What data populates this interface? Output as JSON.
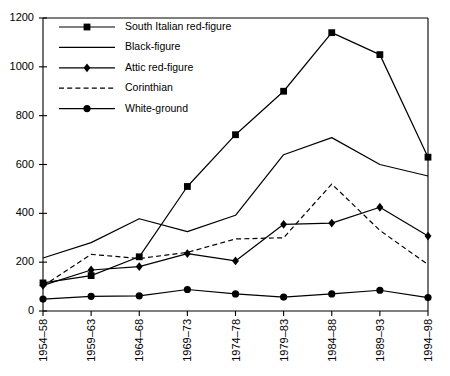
{
  "chart_data": {
    "type": "line",
    "title": "",
    "xlabel": "",
    "ylabel": "",
    "ylim": [
      0,
      1200
    ],
    "yticks": [
      0,
      200,
      400,
      600,
      800,
      1000,
      1200
    ],
    "grid": false,
    "legend_position": "top-left",
    "categories": [
      "1954–58",
      "1959–63",
      "1964–68",
      "1969–73",
      "1974–78",
      "1979–83",
      "1984–88",
      "1989–93",
      "1994–98"
    ],
    "series": [
      {
        "name": "South Italian red-figure",
        "marker": "square",
        "line_style": "solid",
        "color": "#000000",
        "values": [
          115,
          145,
          222,
          510,
          722,
          900,
          1140,
          1050,
          630
        ]
      },
      {
        "name": "Black-figure",
        "marker": "none",
        "line_style": "solid",
        "color": "#000000",
        "values": [
          217,
          280,
          378,
          325,
          392,
          640,
          710,
          600,
          553
        ]
      },
      {
        "name": "Attic red-figure",
        "marker": "diamond",
        "line_style": "solid",
        "color": "#000000",
        "values": [
          105,
          168,
          182,
          235,
          205,
          355,
          360,
          425,
          307
        ]
      },
      {
        "name": "Corinthian",
        "marker": "none",
        "line_style": "dashed",
        "color": "#000000",
        "values": [
          102,
          232,
          215,
          240,
          295,
          300,
          520,
          330,
          190
        ]
      },
      {
        "name": "White-ground",
        "marker": "circle",
        "line_style": "solid",
        "color": "#000000",
        "values": [
          49,
          60,
          62,
          88,
          70,
          57,
          70,
          85,
          55
        ]
      }
    ]
  }
}
